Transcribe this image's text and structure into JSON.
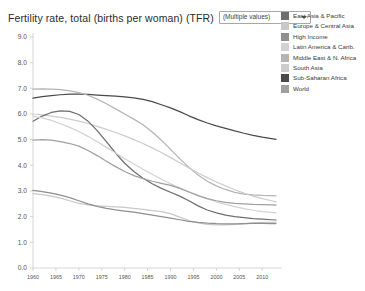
{
  "header": {
    "title": "Fertility rate, total (births per woman) (TFR)",
    "param_dropdown": {
      "value": "(Multiple values)",
      "caret_icon": "chevron-down-icon"
    }
  },
  "legend": {
    "position": "right",
    "items": [
      {
        "label": "East Asia & Pacific",
        "color": "#6e6e6e"
      },
      {
        "label": "Europe & Central Asia",
        "color": "#c9c9c9"
      },
      {
        "label": "High Income",
        "color": "#8f8f8f"
      },
      {
        "label": "Latin America & Carib.",
        "color": "#d2d2d2"
      },
      {
        "label": "Middle East & N. Africa",
        "color": "#b4b4b4"
      },
      {
        "label": "South Asia",
        "color": "#cccccc"
      },
      {
        "label": "Sub-Saharan Africa",
        "color": "#4a4a4a"
      },
      {
        "label": "World",
        "color": "#a0a0a0"
      }
    ]
  },
  "chart_data": {
    "type": "line",
    "title": "Fertility rate, total (births per woman) (TFR)",
    "xlabel": "",
    "ylabel": "",
    "xlim": [
      1960,
      2013
    ],
    "ylim": [
      0.0,
      9.0
    ],
    "grid": false,
    "legend_position": "right",
    "ytick_labels": [
      "0.0",
      "1.0",
      "2.0",
      "3.0",
      "4.0",
      "5.0",
      "6.0",
      "7.0",
      "8.0",
      "9.0"
    ],
    "ytick_values": [
      0.0,
      1.0,
      2.0,
      3.0,
      4.0,
      5.0,
      6.0,
      7.0,
      8.0,
      9.0
    ],
    "xtick_labels": [
      "1960",
      "1965",
      "1970",
      "1975",
      "1980",
      "1985",
      "1990",
      "1995",
      "2000",
      "2005",
      "2010"
    ],
    "xtick_values": [
      1960,
      1965,
      1970,
      1975,
      1980,
      1985,
      1990,
      1995,
      2000,
      2005,
      2010
    ],
    "x": [
      1960,
      1962,
      1964,
      1966,
      1968,
      1970,
      1972,
      1974,
      1976,
      1978,
      1980,
      1982,
      1984,
      1986,
      1988,
      1990,
      1992,
      1994,
      1996,
      1998,
      2000,
      2002,
      2004,
      2006,
      2008,
      2010,
      2012,
      2013
    ],
    "series": [
      {
        "name": "Sub-Saharan Africa",
        "color": "#4a4a4a",
        "values": [
          6.62,
          6.68,
          6.72,
          6.75,
          6.77,
          6.77,
          6.76,
          6.74,
          6.72,
          6.7,
          6.67,
          6.63,
          6.57,
          6.48,
          6.36,
          6.24,
          6.09,
          5.93,
          5.78,
          5.65,
          5.54,
          5.44,
          5.34,
          5.25,
          5.17,
          5.1,
          5.04,
          5.01
        ]
      },
      {
        "name": "Middle East & N. Africa",
        "color": "#b4b4b4",
        "values": [
          6.97,
          6.98,
          6.97,
          6.95,
          6.9,
          6.83,
          6.73,
          6.58,
          6.4,
          6.2,
          6.0,
          5.8,
          5.58,
          5.3,
          4.98,
          4.62,
          4.26,
          3.92,
          3.62,
          3.38,
          3.2,
          3.06,
          2.95,
          2.88,
          2.85,
          2.83,
          2.82,
          2.81
        ]
      },
      {
        "name": "South Asia",
        "color": "#cccccc",
        "values": [
          6.0,
          5.97,
          5.92,
          5.87,
          5.8,
          5.72,
          5.63,
          5.52,
          5.4,
          5.28,
          5.15,
          5.0,
          4.85,
          4.68,
          4.5,
          4.3,
          4.1,
          3.9,
          3.7,
          3.52,
          3.35,
          3.2,
          3.05,
          2.92,
          2.8,
          2.7,
          2.62,
          2.58
        ]
      },
      {
        "name": "East Asia & Pacific",
        "color": "#6e6e6e",
        "values": [
          5.72,
          5.92,
          6.06,
          6.12,
          6.1,
          5.98,
          5.72,
          5.35,
          4.92,
          4.48,
          4.08,
          3.76,
          3.5,
          3.28,
          3.1,
          2.95,
          2.8,
          2.62,
          2.42,
          2.26,
          2.15,
          2.06,
          2.0,
          1.96,
          1.92,
          1.9,
          1.88,
          1.87
        ]
      },
      {
        "name": "Latin America & Carib.",
        "color": "#d2d2d2",
        "values": [
          5.92,
          5.85,
          5.75,
          5.62,
          5.48,
          5.32,
          5.13,
          4.92,
          4.7,
          4.48,
          4.26,
          4.05,
          3.85,
          3.65,
          3.46,
          3.28,
          3.12,
          2.97,
          2.83,
          2.7,
          2.58,
          2.48,
          2.39,
          2.31,
          2.25,
          2.2,
          2.17,
          2.15
        ]
      },
      {
        "name": "World",
        "color": "#a0a0a0",
        "values": [
          4.98,
          5.0,
          4.98,
          4.92,
          4.85,
          4.75,
          4.58,
          4.38,
          4.16,
          3.95,
          3.76,
          3.6,
          3.48,
          3.38,
          3.3,
          3.22,
          3.1,
          2.96,
          2.82,
          2.7,
          2.62,
          2.56,
          2.52,
          2.5,
          2.48,
          2.47,
          2.46,
          2.45
        ]
      },
      {
        "name": "Europe & Central Asia",
        "color": "#c9c9c9",
        "values": [
          2.9,
          2.86,
          2.8,
          2.72,
          2.62,
          2.52,
          2.46,
          2.42,
          2.4,
          2.38,
          2.36,
          2.32,
          2.28,
          2.24,
          2.2,
          2.12,
          1.98,
          1.85,
          1.76,
          1.7,
          1.68,
          1.68,
          1.7,
          1.72,
          1.76,
          1.78,
          1.78,
          1.78
        ]
      },
      {
        "name": "High Income",
        "color": "#8f8f8f",
        "values": [
          3.02,
          2.98,
          2.92,
          2.84,
          2.74,
          2.62,
          2.5,
          2.4,
          2.32,
          2.26,
          2.22,
          2.18,
          2.12,
          2.06,
          2.0,
          1.94,
          1.88,
          1.82,
          1.78,
          1.75,
          1.73,
          1.72,
          1.72,
          1.73,
          1.74,
          1.74,
          1.73,
          1.73
        ]
      }
    ]
  }
}
